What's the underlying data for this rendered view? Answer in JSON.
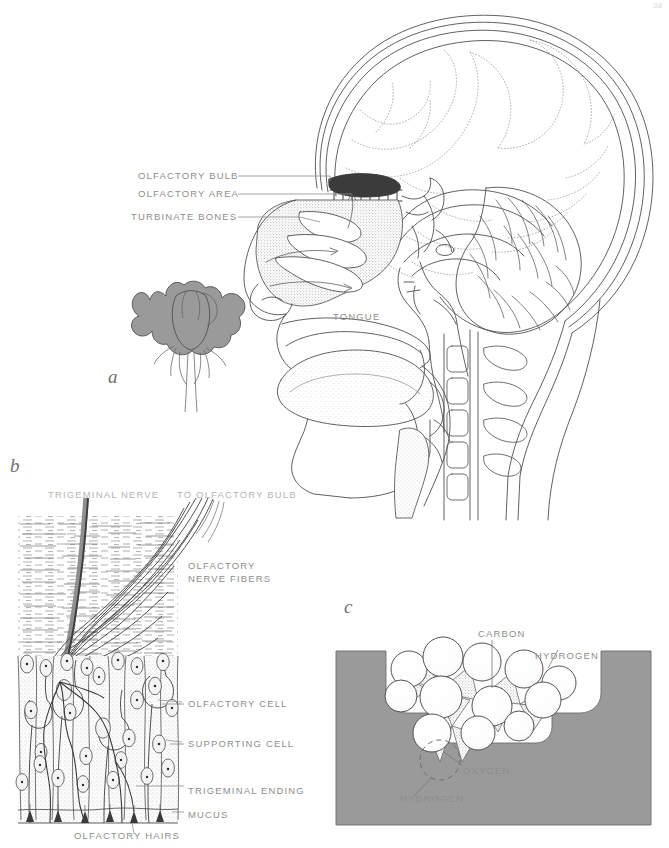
{
  "figure": {
    "page_number": "38",
    "panels": [
      {
        "id": "a",
        "letter": "a",
        "caption": "Sagittal section of the head showing the olfactory pathway and a rose as the odour source"
      },
      {
        "id": "b",
        "letter": "b",
        "caption": "Microscopic structure of the olfactory epithelium"
      },
      {
        "id": "c",
        "letter": "c",
        "caption": "Odour molecule fitting into a receptor site"
      }
    ]
  },
  "panel_a": {
    "letter": "a",
    "labels": [
      {
        "text": "OLFACTORY BULB",
        "name": "label-olfactory-bulb"
      },
      {
        "text": "OLFACTORY AREA",
        "name": "label-olfactory-area"
      },
      {
        "text": "TURBINATE BONES",
        "name": "label-turbinate-bones"
      },
      {
        "text": "TONGUE",
        "name": "label-tongue"
      }
    ],
    "objects": [
      {
        "name": "rose-illustration",
        "fill": "#9a9a9a"
      },
      {
        "name": "head-sagittal-section"
      },
      {
        "name": "brain-section"
      },
      {
        "name": "cerebellum"
      },
      {
        "name": "cervical-vertebrae"
      }
    ]
  },
  "panel_b": {
    "letter": "b",
    "labels": [
      {
        "text": "TRIGEMINAL NERVE",
        "name": "label-trigeminal-nerve"
      },
      {
        "text": "TO OLFACTORY BULB",
        "name": "label-to-olfactory-bulb"
      },
      {
        "text": "OLFACTORY",
        "name": "label-olfactory-nerve-fibers-line1"
      },
      {
        "text": "NERVE FIBERS",
        "name": "label-olfactory-nerve-fibers-line2"
      },
      {
        "text": "OLFACTORY CELL",
        "name": "label-olfactory-cell"
      },
      {
        "text": "SUPPORTING CELL",
        "name": "label-supporting-cell"
      },
      {
        "text": "TRIGEMINAL ENDING",
        "name": "label-trigeminal-ending"
      },
      {
        "text": "MUCUS",
        "name": "label-mucus"
      },
      {
        "text": "OLFACTORY HAIRS",
        "name": "label-olfactory-hairs"
      }
    ]
  },
  "panel_c": {
    "letter": "c",
    "labels": [
      {
        "text": "CARBON",
        "name": "label-carbon"
      },
      {
        "text": "HYDROGEN",
        "name": "label-hydrogen-top"
      },
      {
        "text": "OXYGEN",
        "name": "label-oxygen"
      },
      {
        "text": "HYDROGEN",
        "name": "label-hydrogen-bottom"
      }
    ],
    "colors": {
      "receptor_site_fill": "#9a9a9a",
      "atom_fill": "#ffffff",
      "bond_fill": "#d6d6d6"
    }
  },
  "colors": {
    "ink": "#555555",
    "label_text": "#8e8e8e",
    "gray_fill": "#9a9a9a",
    "stipple": "#bdbdbd",
    "background": "#ffffff"
  }
}
